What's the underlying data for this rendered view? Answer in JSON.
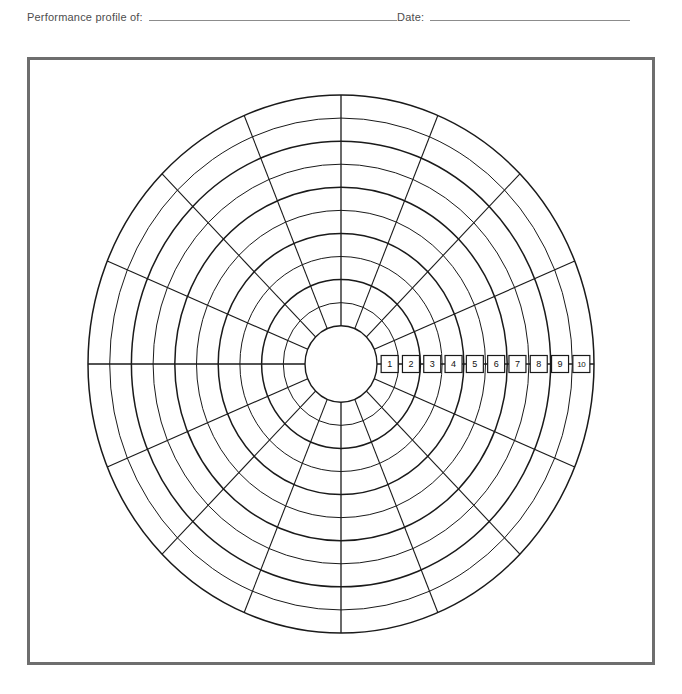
{
  "header": {
    "profile_label": "Performance profile of:",
    "profile_value": "",
    "date_label": "Date:",
    "date_value": ""
  },
  "chart_data": {
    "type": "radar",
    "scale_labels": [
      "1",
      "2",
      "3",
      "4",
      "5",
      "6",
      "7",
      "8",
      "9",
      "10"
    ],
    "rings": 10,
    "spokes": 16,
    "spoke_angle_step_degrees": 22.5,
    "scale_min": 1,
    "scale_max": 10,
    "values": [],
    "legend": [],
    "grid": true,
    "colors": {
      "grid_line": "#1a1a1a",
      "frame_border": "#6e6e6e",
      "header_rule": "#8c8c8c",
      "header_text": "#4d4d4d",
      "background": "#ffffff"
    },
    "geometry": {
      "center_x": 341,
      "center_y": 364,
      "radius_x": 253,
      "radius_y": 269,
      "hub_radius": 36
    }
  }
}
